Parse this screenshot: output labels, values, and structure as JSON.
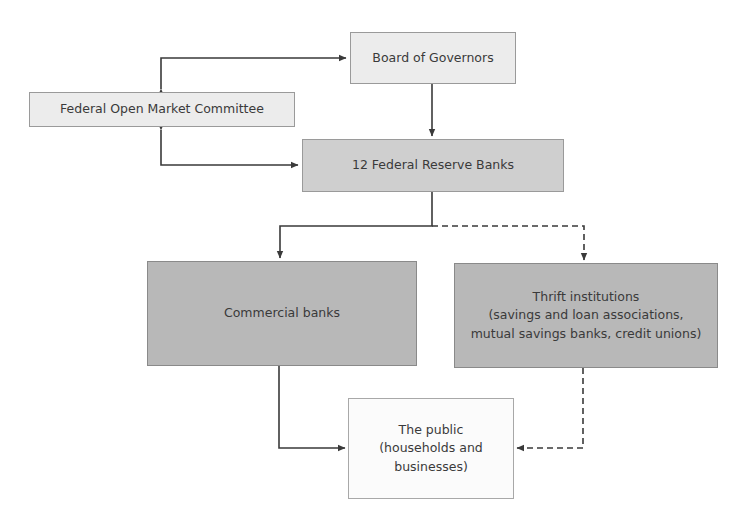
{
  "diagram": {
    "nodes": {
      "board": {
        "label": "Board of Governors"
      },
      "fomc": {
        "label": "Federal Open Market Committee"
      },
      "frb": {
        "label": "12 Federal Reserve Banks"
      },
      "commercial": {
        "label": "Commercial banks"
      },
      "thrift": {
        "line1": "Thrift institutions",
        "line2": "(savings and loan associations,",
        "line3": "mutual savings banks, credit unions)"
      },
      "public": {
        "line1": "The public",
        "line2": "(households and",
        "line3": "businesses)"
      }
    },
    "edges": [
      {
        "from": "fomc",
        "to": "board",
        "style": "solid",
        "bidirectional": true
      },
      {
        "from": "fomc",
        "to": "frb",
        "style": "solid",
        "bidirectional": true
      },
      {
        "from": "board",
        "to": "frb",
        "style": "solid"
      },
      {
        "from": "frb",
        "to": "commercial",
        "style": "solid"
      },
      {
        "from": "frb",
        "to": "thrift",
        "style": "dashed"
      },
      {
        "from": "commercial",
        "to": "public",
        "style": "solid"
      },
      {
        "from": "thrift",
        "to": "public",
        "style": "dashed"
      }
    ],
    "colors": {
      "line": "#3a3a3a",
      "light_box": "#ececec",
      "dark_box": "#b8b8b8"
    }
  }
}
